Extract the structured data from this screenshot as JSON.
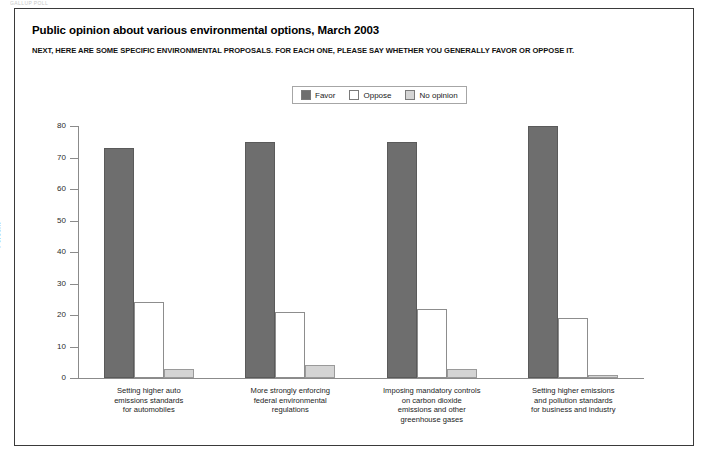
{
  "top_strip": "GALLUP POLL",
  "header": {
    "title": "Public opinion about various environmental options, March 2003",
    "subtitle": "NEXT, HERE ARE SOME SPECIFIC ENVIRONMENTAL PROPOSALS. FOR EACH ONE, PLEASE SAY WHETHER YOU GENERALLY FAVOR OR OPPOSE IT."
  },
  "legend": {
    "position": "top-center",
    "items": [
      {
        "label": "Favor",
        "color": "#6e6e6e"
      },
      {
        "label": "Oppose",
        "color": "#ffffff"
      },
      {
        "label": "No opinion",
        "color": "#d4d4d4"
      }
    ]
  },
  "chart_data": {
    "type": "bar",
    "title": "Public opinion about various environmental options, March 2003",
    "subtitle": "NEXT, HERE ARE SOME SPECIFIC ENVIRONMENTAL PROPOSALS. FOR EACH ONE, PLEASE SAY WHETHER YOU GENERALLY FAVOR OR OPPOSE IT.",
    "xlabel": "",
    "ylabel": "Percent",
    "ylim": [
      0,
      80
    ],
    "yticks": [
      0,
      10,
      20,
      30,
      40,
      50,
      60,
      70,
      80
    ],
    "grid": false,
    "legend_position": "top-center",
    "categories": [
      "Setting higher auto emissions standards for automobiles",
      "More strongly enforcing federal environmental regulations",
      "Imposing mandatory controls on carbon dioxide emissions and other greenhouse gases",
      "Setting higher emissions and pollution standards for business and industry"
    ],
    "category_lines": [
      [
        "Setting higher auto",
        "emissions standards",
        "for automobiles"
      ],
      [
        "More strongly enforcing",
        "federal environmental",
        "regulations"
      ],
      [
        "Imposing mandatory controls",
        "on carbon dioxide",
        "emissions and other",
        "greenhouse gases"
      ],
      [
        "Setting higher emissions",
        "and pollution standards",
        "for business and industry"
      ]
    ],
    "series": [
      {
        "name": "Favor",
        "color": "#6e6e6e",
        "values": [
          73,
          75,
          75,
          80
        ]
      },
      {
        "name": "Oppose",
        "color": "#ffffff",
        "values": [
          24,
          21,
          22,
          19
        ]
      },
      {
        "name": "No opinion",
        "color": "#d4d4d4",
        "values": [
          3,
          4,
          3,
          1
        ]
      }
    ]
  }
}
